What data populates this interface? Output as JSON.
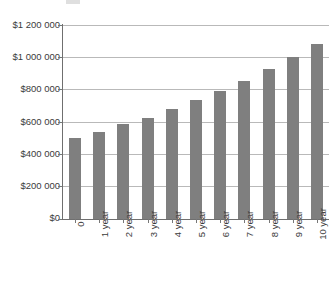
{
  "chart_data": {
    "type": "bar",
    "title": "",
    "xlabel": "",
    "ylabel": "",
    "categories": [
      "0",
      "1 year",
      "2 year",
      "3 year",
      "4 year",
      "5 year",
      "6 year",
      "7 year",
      "8 year",
      "9 year",
      "10 year"
    ],
    "values": [
      500000,
      540000,
      585000,
      625000,
      680000,
      735000,
      790000,
      855000,
      925000,
      1000000,
      1080000
    ],
    "ylim": [
      0,
      1200000
    ],
    "ytick_values": [
      1200000,
      1000000,
      800000,
      600000,
      400000,
      200000,
      0
    ],
    "ytick_labels": [
      "$1 200 000",
      "$1 000 000",
      "$800 000",
      "$600 000",
      "$400 000",
      "$200 000",
      "$0"
    ],
    "grid": true,
    "legend": "none",
    "bar_color": "#7f7f7f",
    "gridline_color": "#b9b9b9",
    "axis_color": "#6f6f6f",
    "background_color": "#ffffff",
    "xtick_label_rotation": "-90"
  }
}
